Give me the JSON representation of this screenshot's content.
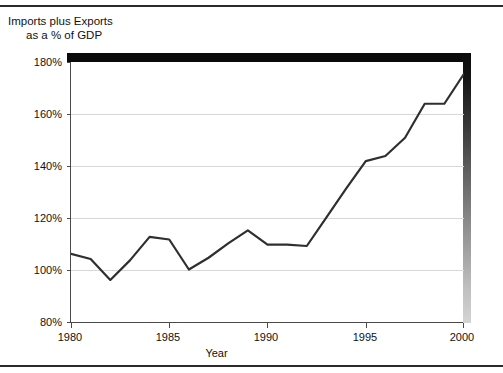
{
  "figure": {
    "title_line1": "Imports plus Exports",
    "title_line2": "as a % of GDP"
  },
  "axes": {
    "x_title": "Year",
    "y_ticks": [
      "80%",
      "100%",
      "120%",
      "140%",
      "160%",
      "180%"
    ],
    "x_ticks": [
      "1980",
      "1985",
      "1990",
      "1995",
      "2000"
    ]
  },
  "colors": {
    "line": "#2f2f2f",
    "grid": "#d8d8d8",
    "axis": "#4a4a4a",
    "shadow": "#0a0a0a",
    "text": "#111111",
    "background": "#ffffff"
  },
  "chart_data": {
    "type": "line",
    "title": "Imports plus Exports as a % of GDP",
    "xlabel": "Year",
    "ylabel": "",
    "xlim": [
      1980,
      2000
    ],
    "ylim": [
      80,
      180
    ],
    "grid": true,
    "legend": "none",
    "x": [
      1980,
      1981,
      1982,
      1983,
      1984,
      1985,
      1986,
      1987,
      1988,
      1989,
      1990,
      1991,
      1992,
      1993,
      1994,
      1995,
      1996,
      1997,
      1998,
      1999,
      2000
    ],
    "series": [
      {
        "name": "Imports plus Exports as a % of GDP",
        "values": [
          106.5,
          104.5,
          96.5,
          104.0,
          113.0,
          112.0,
          100.5,
          105.0,
          110.5,
          115.5,
          110.0,
          110.0,
          109.5,
          120.5,
          131.5,
          142.0,
          144.0,
          151.0,
          164.0,
          164.0,
          175.5
        ]
      }
    ],
    "y_tick_values": [
      80,
      100,
      120,
      140,
      160,
      180
    ],
    "x_tick_values": [
      1980,
      1985,
      1990,
      1995,
      2000
    ],
    "y_tick_labels": [
      "80%",
      "100%",
      "120%",
      "140%",
      "160%",
      "180%"
    ],
    "x_tick_labels": [
      "1980",
      "1985",
      "1990",
      "1995",
      "2000"
    ]
  }
}
